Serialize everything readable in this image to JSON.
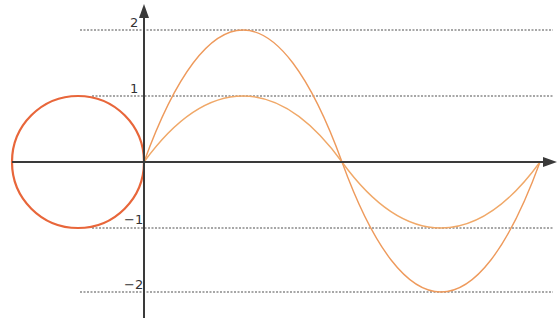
{
  "diagram": {
    "y_tick_labels": [
      "2",
      "1",
      "−1",
      "−2"
    ],
    "y_ticks": [
      2,
      1,
      -1,
      -2
    ],
    "colors": {
      "axis": "#3a3a3a",
      "grid": "#8a8a8a",
      "circle": "#e8663a",
      "curves": "#f0a060"
    },
    "circle": {
      "center": [
        -1,
        0
      ],
      "radius": 1
    },
    "curves": [
      {
        "name": "sin(x)",
        "amplitude": 1
      },
      {
        "name": "2 sin(x)",
        "amplitude": 2
      }
    ]
  }
}
